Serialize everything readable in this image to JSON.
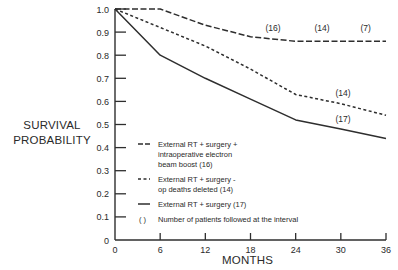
{
  "chart_data": {
    "type": "line",
    "title": "",
    "xlabel": "MONTHS",
    "ylabel": "SURVIVAL PROBABILITY",
    "xlim": [
      0,
      36
    ],
    "ylim": [
      0,
      1.0
    ],
    "x_ticks": [
      0,
      6,
      12,
      18,
      24,
      30,
      36
    ],
    "y_ticks": [
      0,
      0.1,
      0.2,
      0.3,
      0.4,
      0.5,
      0.6,
      0.7,
      0.8,
      0.9,
      1.0
    ],
    "y_tick_labels": [
      "0",
      "0.1",
      "0.2",
      "0.3",
      "0.4",
      "0.5",
      "0.6",
      "0.7",
      "0.8",
      "0.9",
      "1.0"
    ],
    "grid": false,
    "legend_position": "inside lower-left",
    "series": [
      {
        "name": "External RT + surgery + intraoperative electron beam boost (16)",
        "style": "long-dash",
        "x": [
          0,
          6,
          12,
          18,
          24,
          30,
          36
        ],
        "values": [
          1.0,
          1.0,
          0.93,
          0.88,
          0.86,
          0.86,
          0.86
        ],
        "annotations": [
          {
            "x": 21,
            "y": 0.905,
            "text": "(16)"
          },
          {
            "x": 27.5,
            "y": 0.905,
            "text": "(14)"
          },
          {
            "x": 33.3,
            "y": 0.905,
            "text": "(7)"
          }
        ]
      },
      {
        "name": "External RT + surgery - op deaths deleted (14)",
        "style": "short-dash",
        "x": [
          0,
          6,
          12,
          18,
          24,
          30,
          36
        ],
        "values": [
          1.0,
          0.92,
          0.84,
          0.74,
          0.63,
          0.59,
          0.54
        ],
        "annotations": [
          {
            "x": 30.3,
            "y": 0.625,
            "text": "(14)"
          }
        ]
      },
      {
        "name": "External RT + surgery (17)",
        "style": "solid",
        "x": [
          0,
          6,
          12,
          18,
          24,
          30,
          36
        ],
        "values": [
          1.0,
          0.8,
          0.7,
          0.61,
          0.52,
          0.48,
          0.44
        ],
        "annotations": [
          {
            "x": 30.3,
            "y": 0.51,
            "text": "(17)"
          }
        ]
      }
    ],
    "legend": [
      {
        "style": "long-dash",
        "lines": [
          "External RT + surgery +",
          "intraoperative electron",
          "beam boost  (16)"
        ]
      },
      {
        "style": "short-dash",
        "lines": [
          "External RT + surgery -",
          "op deaths deleted  (14)"
        ]
      },
      {
        "style": "solid",
        "lines": [
          "External RT + surgery  (17)"
        ]
      },
      {
        "style": "parens",
        "symbol": "( )",
        "lines": [
          "Number of patients followed at the interval"
        ]
      }
    ]
  },
  "labels": {
    "ylabel_line1": "SURVIVAL",
    "ylabel_line2": "PROBABILITY",
    "xlabel": "MONTHS"
  }
}
